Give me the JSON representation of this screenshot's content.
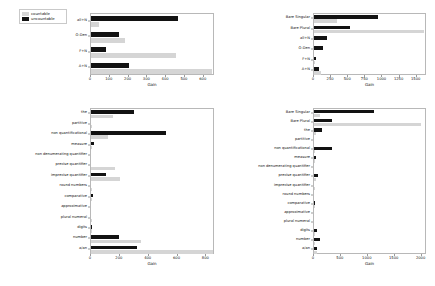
{
  "legend": {
    "position": "upper-left-outside",
    "entries": [
      {
        "label": "countable",
        "color": "#d5d5d5"
      },
      {
        "label": "uncountable",
        "color": "#121212"
      }
    ]
  },
  "chart_data": [
    {
      "id": "top-left",
      "type": "bar",
      "orientation": "horizontal",
      "title": "",
      "xlabel": "Gain",
      "ylabel": "",
      "xlim": [
        0,
        660
      ],
      "xticks": [
        0,
        100,
        200,
        300,
        400,
        500,
        600
      ],
      "xticklabels": [
        "0",
        "100",
        "200",
        "300",
        "400",
        "500",
        "600"
      ],
      "grid": false,
      "categories": [
        "all+N",
        "O-Den",
        "F+N",
        "A+N"
      ],
      "series": [
        {
          "name": "uncountable",
          "color": "#121212",
          "values": [
            465,
            148,
            80,
            200
          ]
        },
        {
          "name": "countable",
          "color": "#d5d5d5",
          "values": [
            45,
            180,
            452,
            645
          ]
        }
      ]
    },
    {
      "id": "top-right",
      "type": "bar",
      "orientation": "horizontal",
      "title": "",
      "xlabel": "Gain",
      "ylabel": "",
      "xlim": [
        0,
        1650
      ],
      "xticks": [
        0,
        250,
        500,
        750,
        1000,
        1250,
        1500
      ],
      "xticklabels": [
        "0",
        "250",
        "500",
        "750",
        "1000",
        "1250",
        "1500"
      ],
      "grid": false,
      "categories": [
        "Bare Singular",
        "Bare Plural",
        "all+N",
        "O-Den",
        "F+N",
        "A+N"
      ],
      "series": [
        {
          "name": "uncountable",
          "color": "#121212",
          "values": [
            930,
            520,
            195,
            130,
            35,
            70
          ]
        },
        {
          "name": "countable",
          "color": "#d5d5d5",
          "values": [
            340,
            1600,
            0,
            0,
            20,
            95
          ]
        }
      ]
    },
    {
      "id": "bottom-left",
      "type": "bar",
      "orientation": "horizontal",
      "title": "",
      "xlabel": "Gain",
      "ylabel": "",
      "xlim": [
        0,
        860
      ],
      "xticks": [
        0,
        200,
        400,
        600,
        800
      ],
      "xticklabels": [
        "0",
        "200",
        "400",
        "600",
        "800"
      ],
      "grid": false,
      "categories": [
        "the",
        "partitive",
        "non quantificational",
        "measure",
        "non denumerating quantifier",
        "precise quantifier",
        "imprecise quantifier",
        "round numbers",
        "comparative",
        "approximative",
        "plural numeral",
        "digits",
        "number",
        "a/an"
      ],
      "series": [
        {
          "name": "uncountable",
          "color": "#121212",
          "values": [
            300,
            0,
            520,
            22,
            0,
            0,
            105,
            0,
            14,
            0,
            0,
            10,
            192,
            320
          ]
        },
        {
          "name": "countable",
          "color": "#d5d5d5",
          "values": [
            150,
            6,
            120,
            4,
            0,
            165,
            200,
            4,
            6,
            0,
            8,
            6,
            345,
            845
          ]
        }
      ]
    },
    {
      "id": "bottom-right",
      "type": "bar",
      "orientation": "horizontal",
      "title": "",
      "xlabel": "Gain",
      "ylabel": "",
      "xlim": [
        0,
        2100
      ],
      "xticks": [
        0,
        500,
        1000,
        1500,
        2000
      ],
      "xticklabels": [
        "0",
        "500",
        "1000",
        "1500",
        "2000"
      ],
      "grid": false,
      "categories": [
        "Bare Singular",
        "Bare Plural",
        "the",
        "partitive",
        "non quantificational",
        "measure",
        "non denumerating quantifier",
        "precise quantifier",
        "imprecise quantifier",
        "round numbers",
        "comparative",
        "approximative",
        "plural numeral",
        "digits",
        "number",
        "a/an"
      ],
      "series": [
        {
          "name": "uncountable",
          "color": "#121212",
          "values": [
            1110,
            330,
            150,
            0,
            330,
            30,
            0,
            75,
            0,
            0,
            20,
            0,
            0,
            55,
            120,
            55
          ]
        },
        {
          "name": "countable",
          "color": "#d5d5d5",
          "values": [
            120,
            1990,
            30,
            0,
            25,
            10,
            0,
            30,
            15,
            0,
            8,
            0,
            0,
            10,
            25,
            60
          ]
        }
      ]
    }
  ]
}
